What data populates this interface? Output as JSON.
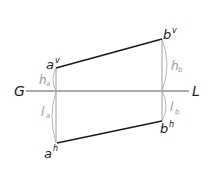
{
  "diagram": {
    "ground_line": {
      "left_label": "G",
      "right_label": "L"
    },
    "points": {
      "a_vertical": {
        "base": "a",
        "sup": "v"
      },
      "b_vertical": {
        "base": "b",
        "sup": "v"
      },
      "a_horizontal": {
        "base": "a",
        "sup": "h"
      },
      "b_horizontal": {
        "base": "b",
        "sup": "h"
      }
    },
    "dimensions": {
      "h_a": {
        "base": "h",
        "sub": "a"
      },
      "h_b": {
        "base": "h",
        "sub": "b"
      },
      "l_a": {
        "base": "l",
        "sub": "a"
      },
      "l_b": {
        "base": "l",
        "sub": "b"
      }
    },
    "colors": {
      "projection_line": "#1a1a1a",
      "ground_line": "#555555",
      "reference_line": "#a0a0a0",
      "dimension_arc": "#b0b0b0",
      "label": "#222222",
      "dimension_label": "#9a9a9a"
    }
  }
}
